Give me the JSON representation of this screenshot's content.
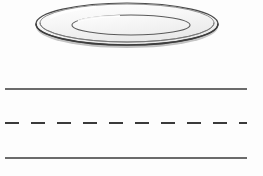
{
  "canvas": {
    "width": 263,
    "height": 176,
    "background_color": "#fdfdfd",
    "title": "Plate above road lane markings"
  },
  "plate": {
    "label": "ceramic-plate",
    "description": "White round plate shown in oblique perspective as nested ellipses",
    "outer_ellipse": {
      "center_x": 127,
      "center_y": 24,
      "radius_x": 91,
      "radius_y": 21,
      "stroke_color": "#4a4a4a",
      "stroke_width": 1.2,
      "fill_color": "#fbfbfb"
    },
    "rim_ellipse": {
      "center_x": 127,
      "center_y": 23,
      "radius_x": 87,
      "radius_y": 19,
      "stroke_color": "#6e6e6e",
      "stroke_width": 0.9,
      "fill_color": "none"
    },
    "inner_ellipse": {
      "center_x": 131,
      "center_y": 25,
      "radius_x": 59,
      "radius_y": 10,
      "stroke_color": "#5a5a5a",
      "stroke_width": 1.1,
      "fill_color": "#fcfcfc"
    },
    "bottom_edge": {
      "stroke_color": "#3d3d3d",
      "stroke_width": 1.6,
      "description": "Thickened shadowed lower rim giving the plate depth"
    },
    "highlight": {
      "color": "#f2f2f2",
      "description": "Soft grey gradient sheen across the plate face"
    }
  },
  "road": {
    "label": "road-lane-markings",
    "line_start_x": 5,
    "line_end_x": 247,
    "stroke_color": "#3a3a3a",
    "lines": [
      {
        "name": "top-edge-line",
        "y": 89,
        "style": "solid",
        "stroke_width": 1.6,
        "dash_length": 0,
        "gap_length": 0
      },
      {
        "name": "center-dashed-line",
        "y": 123,
        "style": "dashed",
        "stroke_width": 2.0,
        "dash_length": 14,
        "gap_length": 12
      },
      {
        "name": "bottom-edge-line",
        "y": 158,
        "style": "solid",
        "stroke_width": 1.6,
        "dash_length": 0,
        "gap_length": 0
      }
    ]
  }
}
